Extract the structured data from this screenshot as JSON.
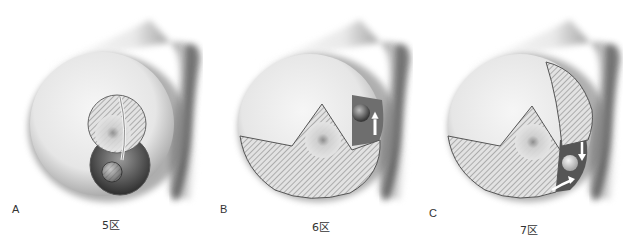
{
  "figure": {
    "panels": [
      {
        "letter": "A",
        "zone_label": "5区"
      },
      {
        "letter": "B",
        "zone_label": "6区"
      },
      {
        "letter": "C",
        "zone_label": "7区"
      }
    ]
  },
  "colors": {
    "background": "#ffffff",
    "tissue": "#e9e9e9",
    "shadow": "#5a5a5a",
    "hatch": "#9a9a9a",
    "label_text": "#333333"
  }
}
